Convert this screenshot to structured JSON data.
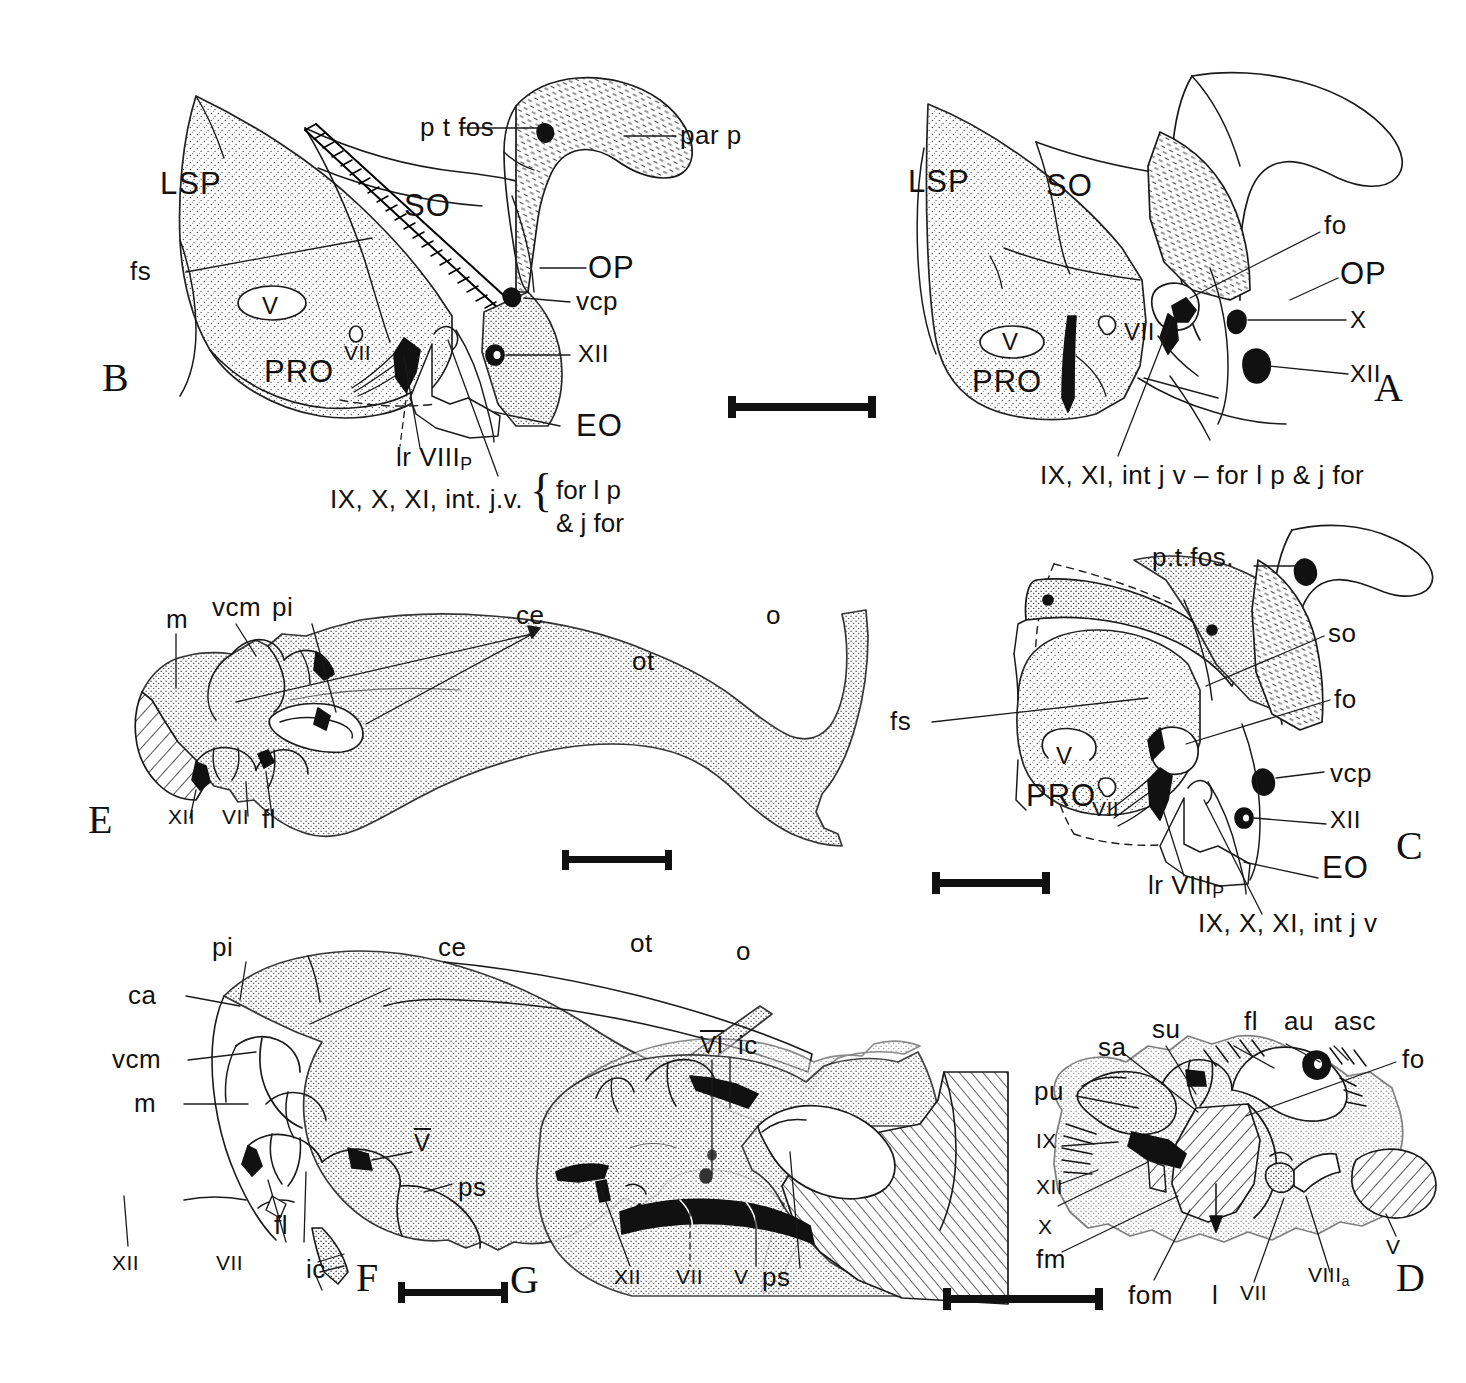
{
  "figure": {
    "type": "scientific-anatomical-line-drawing",
    "panel_count": 7,
    "ink": "#111111",
    "background": "#ffffff"
  },
  "panels": [
    {
      "id": "B",
      "letter": "B",
      "position": "top-left"
    },
    {
      "id": "A",
      "letter": "A",
      "position": "top-right"
    },
    {
      "id": "E",
      "letter": "E",
      "position": "middle-left"
    },
    {
      "id": "C",
      "letter": "C",
      "position": "middle-right"
    },
    {
      "id": "F",
      "letter": "F",
      "position": "bottom-left"
    },
    {
      "id": "G",
      "letter": "G",
      "position": "bottom-center"
    },
    {
      "id": "D",
      "letter": "D",
      "position": "bottom-right"
    }
  ],
  "panel_B": {
    "letter": "B",
    "labels": {
      "lsp": "LSP",
      "so": "SO",
      "pro": "PRO",
      "op": "OP",
      "eo": "EO",
      "pt_fos": "p t fos",
      "par_p": "par p",
      "fs": "fs",
      "vcp": "vcp",
      "v": "V",
      "vii": "VII",
      "xii": "XII",
      "lr_viii_p": "lr VIII",
      "lr_viii_p_sub": "P",
      "nerves": "IX, X, XI, int. j.v.",
      "bracket_line1": "for l p",
      "bracket_line2": "& j for"
    }
  },
  "panel_A": {
    "letter": "A",
    "labels": {
      "lsp": "LSP",
      "so": "SO",
      "pro": "PRO",
      "op": "OP",
      "fo": "fo",
      "v": "V",
      "vii": "VII",
      "x": "X",
      "xii": "XII",
      "nerves": "IX, XI, int j v – for l p & j for"
    }
  },
  "panel_C": {
    "letter": "C",
    "labels": {
      "pt_fos": "p.t.fos.",
      "so": "so",
      "fo": "fo",
      "vcp": "vcp",
      "xii": "XII",
      "fs": "fs",
      "v": "V",
      "vii": "VII",
      "pro": "PRO",
      "eo": "EO",
      "lr_viii_p": "lr VIII",
      "lr_viii_p_sub": "P",
      "nerves": "IX, X, XI, int j v"
    }
  },
  "panel_E": {
    "letter": "E",
    "labels": {
      "m": "m",
      "vcm": "vcm",
      "pi": "pi",
      "ce": "ce",
      "ot": "ot",
      "o": "o",
      "xii": "XII",
      "vii": "VII",
      "fl": "fl"
    }
  },
  "panel_F": {
    "letter": "F",
    "labels": {
      "pi": "pi",
      "ca": "ca",
      "vcm": "vcm",
      "m": "m",
      "ce": "ce",
      "ot": "ot",
      "o": "o",
      "v_overline": "V",
      "ps": "ps",
      "fl": "fl",
      "xii": "XII",
      "vii": "VII",
      "ic": "ic"
    }
  },
  "panel_G": {
    "letter": "G",
    "labels": {
      "vi_overline": "VI",
      "ic": "ic",
      "xii": "XII",
      "vii": "VII",
      "v": "V",
      "ps": "ps"
    }
  },
  "panel_D": {
    "letter": "D",
    "labels": {
      "sa": "sa",
      "su": "su",
      "fl": "fl",
      "au": "au",
      "asc": "asc",
      "fo": "fo",
      "pu": "pu",
      "ix": "IX",
      "xii": "XII",
      "x": "X",
      "fm": "fm",
      "fom": "fom",
      "l": "l",
      "vii": "VII",
      "viii_a": "VIII",
      "viii_a_sub": "a",
      "v": "V"
    }
  },
  "scale_bars": [
    {
      "id": "scale-bar-B-A",
      "x": 728,
      "y": 405,
      "length": 148
    },
    {
      "id": "scale-bar-E",
      "x": 562,
      "y": 858,
      "length": 110
    },
    {
      "id": "scale-bar-C",
      "x": 932,
      "y": 880,
      "length": 118
    },
    {
      "id": "scale-bar-F-G",
      "x": 398,
      "y": 1291,
      "length": 110
    },
    {
      "id": "scale-bar-D",
      "x": 943,
      "y": 1297,
      "length": 160
    }
  ]
}
